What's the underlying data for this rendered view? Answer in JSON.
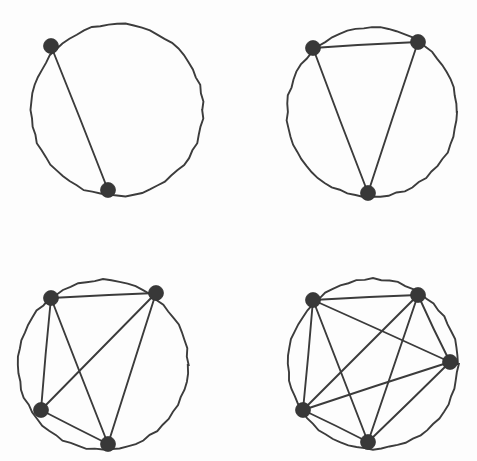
{
  "page": {
    "background_color": "#fdfdfd",
    "width": 477,
    "height": 461,
    "ink_color": "#3b3b3b",
    "vertex_color": "#383838"
  },
  "chart_data": {
    "type": "diagram",
    "title": "",
    "subtitle": "",
    "xlabel": "",
    "ylabel": "",
    "legend": [],
    "annotations": [],
    "figures": [
      {
        "name": "K2",
        "label": "",
        "vertex_count": 2,
        "edge_count": 1,
        "circle": {
          "cx": 117,
          "cy": 110,
          "r": 86
        },
        "vertex_radius": 7.5,
        "vertices": [
          {
            "id": 0,
            "x": 51,
            "y": 46
          },
          {
            "id": 1,
            "x": 108,
            "y": 190
          }
        ],
        "edges": [
          [
            0,
            1
          ]
        ]
      },
      {
        "name": "K3",
        "label": "",
        "vertex_count": 3,
        "edge_count": 3,
        "circle": {
          "cx": 372,
          "cy": 112,
          "r": 85
        },
        "vertex_radius": 7.5,
        "vertices": [
          {
            "id": 0,
            "x": 313,
            "y": 48
          },
          {
            "id": 1,
            "x": 418,
            "y": 42
          },
          {
            "id": 2,
            "x": 368,
            "y": 193
          }
        ],
        "edges": [
          [
            0,
            1
          ],
          [
            0,
            2
          ],
          [
            1,
            2
          ]
        ]
      },
      {
        "name": "K4",
        "label": "",
        "vertex_count": 4,
        "edge_count": 6,
        "circle": {
          "cx": 103,
          "cy": 365,
          "r": 85
        },
        "vertex_radius": 7.5,
        "vertices": [
          {
            "id": 0,
            "x": 51,
            "y": 298
          },
          {
            "id": 1,
            "x": 156,
            "y": 293
          },
          {
            "id": 2,
            "x": 41,
            "y": 410
          },
          {
            "id": 3,
            "x": 108,
            "y": 444
          }
        ],
        "edges": [
          [
            0,
            1
          ],
          [
            0,
            2
          ],
          [
            0,
            3
          ],
          [
            1,
            2
          ],
          [
            1,
            3
          ],
          [
            2,
            3
          ]
        ]
      },
      {
        "name": "K5",
        "label": "",
        "vertex_count": 5,
        "edge_count": 10,
        "circle": {
          "cx": 373,
          "cy": 364,
          "r": 85
        },
        "vertex_radius": 7.5,
        "vertices": [
          {
            "id": 0,
            "x": 313,
            "y": 300
          },
          {
            "id": 1,
            "x": 418,
            "y": 295
          },
          {
            "id": 2,
            "x": 450,
            "y": 362
          },
          {
            "id": 3,
            "x": 303,
            "y": 410
          },
          {
            "id": 4,
            "x": 368,
            "y": 442
          }
        ],
        "edges": [
          [
            0,
            1
          ],
          [
            0,
            2
          ],
          [
            0,
            3
          ],
          [
            0,
            4
          ],
          [
            1,
            2
          ],
          [
            1,
            3
          ],
          [
            1,
            4
          ],
          [
            2,
            3
          ],
          [
            2,
            4
          ],
          [
            3,
            4
          ]
        ]
      }
    ]
  }
}
